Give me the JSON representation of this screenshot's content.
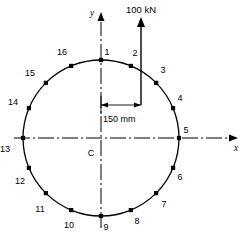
{
  "figure": {
    "centroid_label": "C",
    "axes": {
      "x_label": "x",
      "y_label": "y"
    },
    "load": {
      "magnitude_label": "100 kN",
      "direction": "up"
    },
    "dimension": {
      "label": "150 mm",
      "from": "centroid",
      "to": "load-line"
    },
    "circle": {
      "center_x": 101,
      "center_y": 138,
      "radius": 78
    },
    "nodes": [
      {
        "id": "1",
        "angle_deg": 90.0,
        "label": "1",
        "lx": 107,
        "ly": 55
      },
      {
        "id": "2",
        "angle_deg": 67.5,
        "label": "2",
        "lx": 135,
        "ly": 56
      },
      {
        "id": "3",
        "angle_deg": 45.0,
        "label": "3",
        "lx": 163,
        "ly": 73
      },
      {
        "id": "4",
        "angle_deg": 22.5,
        "label": "4",
        "lx": 180,
        "ly": 101
      },
      {
        "id": "5",
        "angle_deg": 0.0,
        "label": "5",
        "lx": 186,
        "ly": 133
      },
      {
        "id": "6",
        "angle_deg": -22.5,
        "label": "6",
        "lx": 180,
        "ly": 180
      },
      {
        "id": "7",
        "angle_deg": -45.0,
        "label": "7",
        "lx": 164,
        "ly": 207
      },
      {
        "id": "8",
        "angle_deg": -67.5,
        "label": "8",
        "lx": 137,
        "ly": 224
      },
      {
        "id": "9",
        "angle_deg": -90.0,
        "label": "9",
        "lx": 106,
        "ly": 230
      },
      {
        "id": "10",
        "angle_deg": -112.5,
        "label": "10",
        "lx": 69,
        "ly": 228
      },
      {
        "id": "11",
        "angle_deg": -135.0,
        "label": "11",
        "lx": 40,
        "ly": 212
      },
      {
        "id": "12",
        "angle_deg": -157.5,
        "label": "12",
        "lx": 20,
        "ly": 184
      },
      {
        "id": "13",
        "angle_deg": 180.0,
        "label": "13",
        "lx": 5,
        "ly": 152
      },
      {
        "id": "14",
        "angle_deg": 157.5,
        "label": "14",
        "lx": 13,
        "ly": 105
      },
      {
        "id": "15",
        "angle_deg": 135.0,
        "label": "15",
        "lx": 30,
        "ly": 76
      },
      {
        "id": "16",
        "angle_deg": 112.5,
        "label": "16",
        "lx": 62,
        "ly": 55
      }
    ],
    "colors": {
      "stroke": "#000000",
      "background": "#ffffff",
      "node_fill": "#000000"
    }
  }
}
